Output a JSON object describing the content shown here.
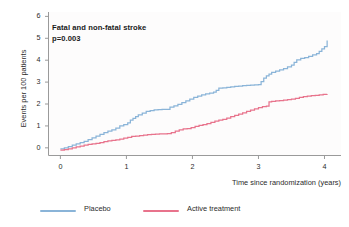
{
  "chart_data": {
    "type": "line",
    "subtype": "kaplan-meier-cumulative-incidence-step",
    "title": "",
    "annotation_title": "Fatal and non-fatal stroke",
    "annotation_pvalue": "p=0.003",
    "xlabel": "Time since randomization (years)",
    "ylabel": "Events per 100 patients",
    "xlim": [
      -0.18,
      4.25
    ],
    "ylim": [
      -0.35,
      6.2
    ],
    "xticks": [
      0,
      1,
      2,
      3,
      4
    ],
    "xticklabels": [
      "0",
      "1",
      "2",
      "3",
      "4"
    ],
    "yticks": [
      0,
      1,
      2,
      3,
      4,
      5,
      6
    ],
    "yticklabels": [
      "0",
      "1",
      "2",
      "3",
      "4",
      "5",
      "6"
    ],
    "grid": false,
    "legend_position": "below-axes",
    "spines": [
      "left",
      "bottom"
    ],
    "plot_background": "#fdfcfc",
    "series": [
      {
        "name": "Placebo",
        "color": "#8ab4d8",
        "final_value": 4.9,
        "x": [
          0.0,
          0.06,
          0.12,
          0.18,
          0.24,
          0.3,
          0.36,
          0.42,
          0.48,
          0.54,
          0.6,
          0.66,
          0.72,
          0.78,
          0.84,
          0.9,
          0.96,
          1.02,
          1.06,
          1.1,
          1.14,
          1.18,
          1.24,
          1.3,
          1.36,
          1.42,
          1.48,
          1.54,
          1.6,
          1.66,
          1.72,
          1.78,
          1.84,
          1.9,
          1.96,
          2.02,
          2.08,
          2.14,
          2.2,
          2.26,
          2.32,
          2.36,
          2.4,
          2.46,
          2.52,
          2.58,
          2.64,
          2.7,
          2.76,
          2.82,
          2.88,
          2.94,
          3.0,
          3.04,
          3.08,
          3.12,
          3.16,
          3.2,
          3.26,
          3.32,
          3.38,
          3.44,
          3.5,
          3.54,
          3.58,
          3.64,
          3.7,
          3.76,
          3.82,
          3.88,
          3.92,
          3.96,
          4.0,
          4.04
        ],
        "y": [
          -0.05,
          0.0,
          0.06,
          0.12,
          0.18,
          0.24,
          0.3,
          0.38,
          0.46,
          0.54,
          0.62,
          0.7,
          0.76,
          0.82,
          0.9,
          1.0,
          1.06,
          1.14,
          1.26,
          1.34,
          1.42,
          1.5,
          1.58,
          1.66,
          1.7,
          1.73,
          1.74,
          1.75,
          1.76,
          1.86,
          1.92,
          1.98,
          2.06,
          2.14,
          2.22,
          2.3,
          2.36,
          2.42,
          2.46,
          2.5,
          2.54,
          2.62,
          2.72,
          2.74,
          2.76,
          2.78,
          2.8,
          2.82,
          2.84,
          2.85,
          2.86,
          2.87,
          2.88,
          3.02,
          3.18,
          3.28,
          3.36,
          3.44,
          3.5,
          3.56,
          3.62,
          3.7,
          3.78,
          3.9,
          4.02,
          4.08,
          4.12,
          4.18,
          4.24,
          4.3,
          4.4,
          4.52,
          4.62,
          4.9
        ]
      },
      {
        "name": "Active treatment",
        "color": "#e8738c",
        "final_value": 2.45,
        "x": [
          0.0,
          0.06,
          0.12,
          0.18,
          0.24,
          0.3,
          0.36,
          0.42,
          0.48,
          0.54,
          0.6,
          0.66,
          0.72,
          0.78,
          0.84,
          0.9,
          0.96,
          1.02,
          1.08,
          1.14,
          1.2,
          1.26,
          1.32,
          1.38,
          1.44,
          1.5,
          1.56,
          1.62,
          1.68,
          1.74,
          1.8,
          1.86,
          1.92,
          1.98,
          2.04,
          2.1,
          2.16,
          2.22,
          2.28,
          2.34,
          2.4,
          2.46,
          2.52,
          2.58,
          2.64,
          2.7,
          2.76,
          2.82,
          2.88,
          2.94,
          3.0,
          3.06,
          3.12,
          3.16,
          3.2,
          3.26,
          3.32,
          3.38,
          3.44,
          3.5,
          3.56,
          3.62,
          3.68,
          3.74,
          3.8,
          3.86,
          3.92,
          3.98,
          4.04
        ],
        "y": [
          -0.1,
          -0.08,
          -0.05,
          0.0,
          0.04,
          0.08,
          0.12,
          0.16,
          0.18,
          0.2,
          0.24,
          0.28,
          0.32,
          0.34,
          0.36,
          0.4,
          0.44,
          0.48,
          0.52,
          0.54,
          0.56,
          0.58,
          0.6,
          0.62,
          0.63,
          0.64,
          0.64,
          0.65,
          0.7,
          0.76,
          0.82,
          0.86,
          0.88,
          0.92,
          0.98,
          1.02,
          1.06,
          1.1,
          1.16,
          1.22,
          1.26,
          1.3,
          1.36,
          1.42,
          1.48,
          1.54,
          1.6,
          1.66,
          1.72,
          1.78,
          1.84,
          1.88,
          1.9,
          2.1,
          2.12,
          2.14,
          2.16,
          2.18,
          2.2,
          2.22,
          2.26,
          2.3,
          2.34,
          2.36,
          2.38,
          2.4,
          2.42,
          2.44,
          2.45
        ]
      }
    ]
  },
  "legend": {
    "items": [
      {
        "label": "Placebo",
        "color": "#8ab4d8"
      },
      {
        "label": "Active treatment",
        "color": "#e8738c"
      }
    ]
  }
}
